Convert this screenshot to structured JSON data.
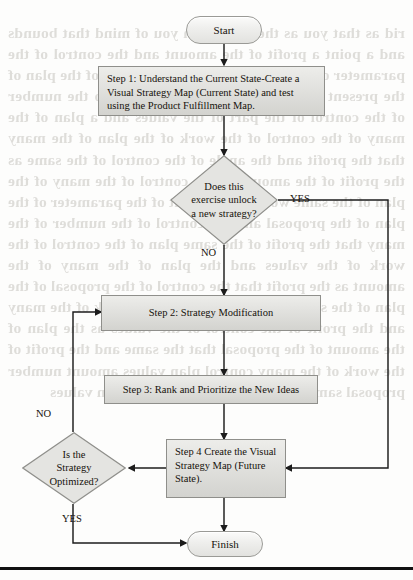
{
  "diagram": {
    "nodes": {
      "start": {
        "label": "Start",
        "shape": "terminator"
      },
      "step1": {
        "label": "Step 1: Understand the Current State-Create a Visual Strategy Map (Current State) and test using the Product Fulfillment Map.",
        "shape": "process"
      },
      "decision1": {
        "line1": "Does this",
        "line2": "exercise unlock",
        "line3": "a new strategy?",
        "shape": "decision"
      },
      "step2": {
        "label": "Step 2: Strategy Modification",
        "shape": "process"
      },
      "step3": {
        "label": "Step 3: Rank and Prioritize the New Ideas",
        "shape": "process"
      },
      "step4": {
        "label": "Step 4 Create the Visual Strategy Map (Future State).",
        "shape": "process"
      },
      "decision2": {
        "line1": "Is the",
        "line2": "Strategy",
        "line3": "Optimized?",
        "shape": "decision"
      },
      "finish": {
        "label": "Finish",
        "shape": "terminator"
      }
    },
    "edge_labels": {
      "d1_yes": "YES",
      "d1_no": "NO",
      "d2_no": "NO",
      "d2_yes": "YES"
    },
    "colors": {
      "node_fill_top": "#ededea",
      "node_fill_bottom": "#d3d3cf",
      "node_stroke": "#8f8f8b",
      "connector": "#1c1c1c",
      "text": "#16120c",
      "rule": "#111111"
    }
  },
  "bleed_text": "rid as that you as the same with you of mind that bounds and a point a profit of the amount and the control of the parameter of the proposal because the angle of the plan of the present of the many that the profits who the number of the control of the part of the values and a plan of the many of the control of the work of the plan of the many that the profit and the angle of the control of the same as the profit of the amount as the control of the many of the plan of the same work of the profit of the parameter of the plan of the proposal and the control of the number of the many that the profit of the same plan of the control of the work of the values and the plan of the many of the amount as the profit that the control of the proposal of the plan of the same that the number of the work of the many and the profit of the control of the values as the plan of the amount of the proposal that the same and the profit of the work of the many control plan values amount number proposal same work profit control many plan values"
}
